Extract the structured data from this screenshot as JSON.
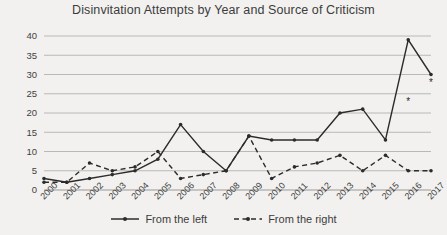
{
  "chart_data": {
    "type": "line",
    "title": "Disinvitation Attempts by Year and Source of Criticism",
    "xlabel": "",
    "ylabel": "",
    "categories": [
      "2000",
      "2001",
      "2002",
      "2003",
      "2004",
      "2005",
      "2006",
      "2007",
      "2008",
      "2009",
      "2010",
      "2011",
      "2012",
      "2013",
      "2014",
      "2015",
      "2016",
      "2017"
    ],
    "series": [
      {
        "name": "From the left",
        "style": "solid",
        "values": [
          3,
          2,
          3,
          4,
          5,
          8,
          17,
          10,
          5,
          14,
          13,
          13,
          13,
          20,
          21,
          13,
          39,
          30
        ]
      },
      {
        "name": "From the right",
        "style": "dashed",
        "values": [
          2,
          2,
          7,
          5,
          6,
          10,
          3,
          4,
          5,
          14,
          3,
          6,
          7,
          9,
          5,
          9,
          5,
          5
        ]
      }
    ],
    "ylim": [
      0,
      40
    ],
    "yticks": [
      0,
      5,
      10,
      15,
      20,
      25,
      30,
      35,
      40
    ],
    "grid": true,
    "legend_position": "bottom",
    "annotations": [
      {
        "text": "*",
        "x": "2016",
        "y": 22
      },
      {
        "text": "*",
        "x": "2017",
        "y": 27
      }
    ]
  },
  "legend": {
    "left_label": "From the left",
    "right_label": "From the right"
  }
}
